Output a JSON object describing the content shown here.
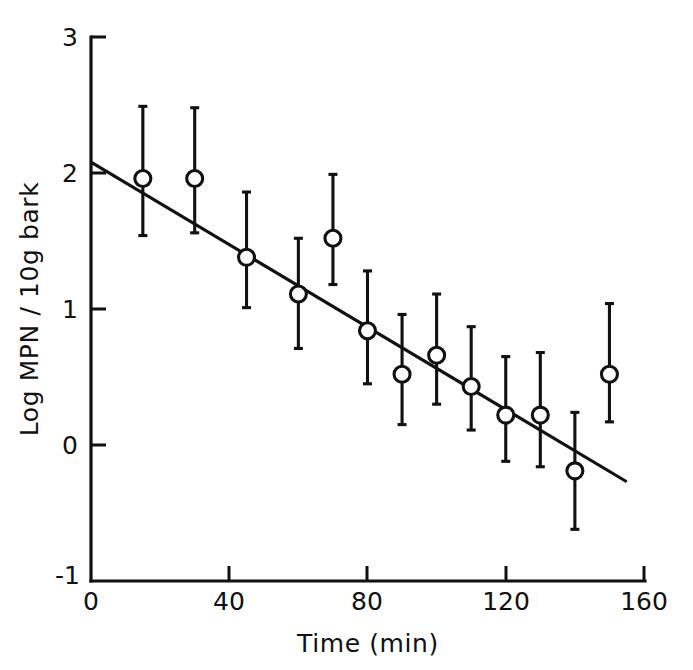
{
  "chart_data": {
    "type": "scatter",
    "title": "",
    "xlabel": "Time (min)",
    "ylabel": "Log MPN / 10g bark",
    "xlim": [
      0,
      160
    ],
    "ylim": [
      -1,
      3
    ],
    "xticks": [
      0,
      40,
      80,
      120,
      160
    ],
    "xticklabels": [
      "0",
      "40",
      "80",
      "120",
      "160"
    ],
    "yticks": [
      -1,
      0,
      1,
      2,
      3
    ],
    "yticklabels": [
      "-1",
      "0",
      "1",
      "2",
      "3"
    ],
    "grid": false,
    "legend": null,
    "marker_style": "open-circle",
    "x": [
      15,
      30,
      45,
      60,
      70,
      80,
      90,
      100,
      110,
      120,
      130,
      140,
      150
    ],
    "y": [
      1.96,
      1.96,
      1.38,
      1.11,
      1.52,
      0.84,
      0.52,
      0.66,
      0.43,
      0.22,
      0.22,
      -0.19,
      0.52
    ],
    "yerr_upper": [
      0.53,
      0.52,
      0.48,
      0.41,
      0.47,
      0.44,
      0.44,
      0.45,
      0.44,
      0.43,
      0.46,
      0.43,
      0.52
    ],
    "yerr_lower": [
      0.42,
      0.4,
      0.37,
      0.4,
      0.34,
      0.39,
      0.37,
      0.36,
      0.32,
      0.34,
      0.38,
      0.43,
      0.35
    ],
    "series": [
      {
        "name": "Log MPN / 10g bark",
        "values": [
          1.96,
          1.96,
          1.38,
          1.11,
          1.52,
          0.84,
          0.52,
          0.66,
          0.43,
          0.22,
          0.22,
          -0.19,
          0.52
        ]
      }
    ],
    "fit_line": {
      "type": "linear-regression",
      "x_start": 0,
      "y_start": 2.08,
      "x_end": 155,
      "y_end": -0.27,
      "slope": -0.01516,
      "intercept": 2.08
    }
  },
  "axes": {
    "x_axis_title": "Time (min)",
    "y_axis_title": "Log MPN / 10g bark"
  }
}
